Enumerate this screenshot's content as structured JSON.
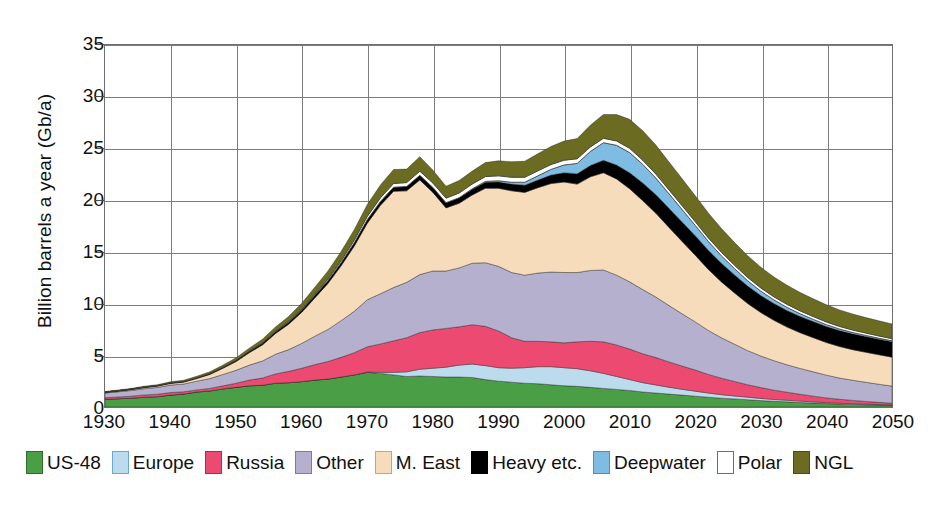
{
  "chart_data": {
    "type": "area",
    "title": "",
    "subtitle": "",
    "xlabel": "",
    "ylabel": "Billion barrels a year (Gb/a)",
    "xlim": [
      1930,
      2050
    ],
    "ylim": [
      0,
      35
    ],
    "grid": true,
    "stacked": true,
    "legend_position": "bottom",
    "xticks": [
      1930,
      1940,
      1950,
      1960,
      1970,
      1980,
      1990,
      2000,
      2010,
      2020,
      2030,
      2040,
      2050
    ],
    "yticks": [
      0,
      5,
      10,
      15,
      20,
      25,
      30,
      35
    ],
    "x": [
      1930,
      1932,
      1934,
      1936,
      1938,
      1940,
      1942,
      1944,
      1946,
      1948,
      1950,
      1952,
      1954,
      1956,
      1958,
      1960,
      1962,
      1964,
      1966,
      1968,
      1970,
      1972,
      1974,
      1976,
      1978,
      1980,
      1982,
      1984,
      1986,
      1988,
      1990,
      1992,
      1994,
      1996,
      1998,
      2000,
      2002,
      2004,
      2006,
      2008,
      2010,
      2012,
      2014,
      2016,
      2018,
      2020,
      2022,
      2024,
      2026,
      2028,
      2030,
      2032,
      2034,
      2036,
      2038,
      2040,
      2042,
      2044,
      2046,
      2048,
      2050
    ],
    "series": [
      {
        "name": "US-48",
        "color": "#4a9e46",
        "values": [
          0.75,
          0.8,
          0.85,
          0.95,
          1.0,
          1.15,
          1.25,
          1.45,
          1.55,
          1.75,
          1.9,
          2.05,
          2.1,
          2.3,
          2.35,
          2.45,
          2.6,
          2.7,
          2.9,
          3.1,
          3.35,
          3.25,
          3.1,
          2.95,
          3.0,
          2.95,
          2.9,
          2.9,
          2.85,
          2.65,
          2.5,
          2.4,
          2.3,
          2.25,
          2.15,
          2.05,
          2.0,
          1.9,
          1.8,
          1.7,
          1.6,
          1.45,
          1.35,
          1.25,
          1.15,
          1.05,
          0.95,
          0.85,
          0.78,
          0.7,
          0.62,
          0.55,
          0.5,
          0.44,
          0.38,
          0.33,
          0.29,
          0.25,
          0.22,
          0.19,
          0.16
        ]
      },
      {
        "name": "Europe",
        "color": "#bcdcee",
        "values": [
          0.0,
          0.0,
          0.0,
          0.0,
          0.0,
          0.0,
          0.0,
          0.0,
          0.0,
          0.0,
          0.0,
          0.0,
          0.0,
          0.0,
          0.0,
          0.0,
          0.0,
          0.0,
          0.0,
          0.0,
          0.02,
          0.1,
          0.25,
          0.45,
          0.65,
          0.8,
          0.95,
          1.15,
          1.3,
          1.35,
          1.3,
          1.35,
          1.5,
          1.65,
          1.75,
          1.75,
          1.7,
          1.6,
          1.45,
          1.25,
          1.05,
          0.9,
          0.78,
          0.66,
          0.56,
          0.48,
          0.4,
          0.34,
          0.29,
          0.25,
          0.21,
          0.18,
          0.15,
          0.13,
          0.11,
          0.09,
          0.08,
          0.07,
          0.06,
          0.05,
          0.04
        ]
      },
      {
        "name": "Russia",
        "color": "#ed4a72",
        "values": [
          0.15,
          0.17,
          0.2,
          0.22,
          0.24,
          0.25,
          0.22,
          0.2,
          0.25,
          0.3,
          0.4,
          0.55,
          0.7,
          0.9,
          1.1,
          1.3,
          1.5,
          1.7,
          1.9,
          2.15,
          2.45,
          2.75,
          3.05,
          3.3,
          3.55,
          3.7,
          3.75,
          3.7,
          3.8,
          3.8,
          3.55,
          2.95,
          2.55,
          2.45,
          2.4,
          2.4,
          2.6,
          2.85,
          3.05,
          3.05,
          2.95,
          2.8,
          2.65,
          2.45,
          2.25,
          2.05,
          1.8,
          1.6,
          1.4,
          1.2,
          1.05,
          0.9,
          0.78,
          0.66,
          0.56,
          0.46,
          0.38,
          0.32,
          0.26,
          0.21,
          0.17
        ]
      },
      {
        "name": "Other",
        "color": "#b4b0cd",
        "values": [
          0.45,
          0.5,
          0.55,
          0.6,
          0.65,
          0.72,
          0.75,
          0.85,
          0.95,
          1.1,
          1.25,
          1.45,
          1.65,
          1.9,
          2.1,
          2.4,
          2.75,
          3.1,
          3.55,
          4.0,
          4.55,
          4.85,
          5.15,
          5.35,
          5.6,
          5.7,
          5.55,
          5.7,
          5.95,
          6.15,
          6.25,
          6.3,
          6.4,
          6.6,
          6.75,
          6.8,
          6.7,
          6.85,
          6.95,
          6.75,
          6.5,
          6.2,
          5.85,
          5.45,
          5.05,
          4.65,
          4.25,
          3.9,
          3.6,
          3.3,
          3.05,
          2.85,
          2.65,
          2.5,
          2.35,
          2.2,
          2.05,
          1.95,
          1.85,
          1.75,
          1.65
        ]
      },
      {
        "name": "M. East",
        "color": "#f7dcbb",
        "values": [
          0.05,
          0.06,
          0.08,
          0.1,
          0.12,
          0.15,
          0.18,
          0.25,
          0.4,
          0.6,
          0.85,
          1.2,
          1.55,
          2.0,
          2.45,
          3.0,
          3.7,
          4.45,
          5.3,
          6.3,
          7.4,
          8.55,
          9.3,
          8.85,
          9.15,
          7.6,
          6.1,
          6.25,
          6.6,
          7.2,
          7.55,
          7.9,
          8.0,
          8.25,
          8.55,
          8.75,
          8.55,
          9.05,
          9.4,
          9.3,
          9.0,
          8.6,
          8.1,
          7.55,
          7.0,
          6.45,
          5.9,
          5.4,
          4.95,
          4.55,
          4.2,
          3.9,
          3.65,
          3.45,
          3.3,
          3.15,
          3.05,
          2.95,
          2.9,
          2.85,
          2.8
        ]
      },
      {
        "name": "Heavy etc.",
        "color": "#000000",
        "values": [
          0.05,
          0.05,
          0.05,
          0.06,
          0.06,
          0.07,
          0.07,
          0.08,
          0.09,
          0.1,
          0.12,
          0.14,
          0.16,
          0.18,
          0.2,
          0.22,
          0.25,
          0.28,
          0.3,
          0.33,
          0.36,
          0.38,
          0.4,
          0.42,
          0.45,
          0.48,
          0.5,
          0.52,
          0.55,
          0.58,
          0.6,
          0.65,
          0.7,
          0.75,
          0.82,
          0.9,
          1.0,
          1.1,
          1.2,
          1.35,
          1.55,
          1.7,
          1.8,
          1.85,
          1.88,
          1.88,
          1.85,
          1.8,
          1.75,
          1.7,
          1.65,
          1.62,
          1.6,
          1.58,
          1.56,
          1.55,
          1.54,
          1.53,
          1.52,
          1.51,
          1.5
        ]
      },
      {
        "name": "Deepwater",
        "color": "#7fbce4",
        "values": [
          0.0,
          0.0,
          0.0,
          0.0,
          0.0,
          0.0,
          0.0,
          0.0,
          0.0,
          0.0,
          0.0,
          0.0,
          0.0,
          0.0,
          0.0,
          0.0,
          0.0,
          0.0,
          0.0,
          0.0,
          0.0,
          0.0,
          0.0,
          0.0,
          0.0,
          0.0,
          0.0,
          0.02,
          0.05,
          0.08,
          0.12,
          0.18,
          0.28,
          0.4,
          0.55,
          0.75,
          1.0,
          1.35,
          1.7,
          1.9,
          1.95,
          1.8,
          1.6,
          1.4,
          1.2,
          1.0,
          0.85,
          0.72,
          0.6,
          0.5,
          0.42,
          0.35,
          0.3,
          0.25,
          0.21,
          0.18,
          0.15,
          0.13,
          0.11,
          0.09,
          0.08
        ]
      },
      {
        "name": "Polar",
        "color": "#ffffff",
        "values": [
          0.0,
          0.0,
          0.0,
          0.0,
          0.0,
          0.0,
          0.0,
          0.0,
          0.0,
          0.0,
          0.0,
          0.0,
          0.02,
          0.04,
          0.06,
          0.08,
          0.1,
          0.14,
          0.18,
          0.24,
          0.3,
          0.34,
          0.36,
          0.38,
          0.4,
          0.42,
          0.44,
          0.45,
          0.46,
          0.47,
          0.48,
          0.48,
          0.48,
          0.48,
          0.47,
          0.46,
          0.45,
          0.44,
          0.43,
          0.42,
          0.41,
          0.4,
          0.39,
          0.38,
          0.37,
          0.36,
          0.35,
          0.34,
          0.33,
          0.32,
          0.31,
          0.3,
          0.29,
          0.28,
          0.27,
          0.26,
          0.25,
          0.24,
          0.23,
          0.22,
          0.21
        ]
      },
      {
        "name": "NGL",
        "color": "#6b6b22",
        "values": [
          0.05,
          0.06,
          0.07,
          0.08,
          0.09,
          0.1,
          0.12,
          0.14,
          0.17,
          0.2,
          0.25,
          0.3,
          0.36,
          0.42,
          0.5,
          0.58,
          0.68,
          0.78,
          0.9,
          1.02,
          1.15,
          1.25,
          1.35,
          1.3,
          1.4,
          1.25,
          1.15,
          1.2,
          1.25,
          1.35,
          1.45,
          1.5,
          1.55,
          1.65,
          1.75,
          1.85,
          1.95,
          2.1,
          2.3,
          2.55,
          2.8,
          2.85,
          2.8,
          2.7,
          2.6,
          2.5,
          2.4,
          2.3,
          2.2,
          2.1,
          2.0,
          1.92,
          1.85,
          1.78,
          1.72,
          1.66,
          1.6,
          1.55,
          1.5,
          1.46,
          1.42
        ]
      }
    ]
  },
  "legend": {
    "items": [
      {
        "label": "US-48",
        "color": "#4a9e46",
        "border": "#2f6d2c"
      },
      {
        "label": "Europe",
        "color": "#bcdcee",
        "border": "#6ba8cd"
      },
      {
        "label": "Russia",
        "color": "#ed4a72",
        "border": "#b8284c"
      },
      {
        "label": "Other",
        "color": "#b4b0cd",
        "border": "#7f7b9c"
      },
      {
        "label": "M. East",
        "color": "#f7dcbb",
        "border": "#c9a478"
      },
      {
        "label": "Heavy etc.",
        "color": "#000000",
        "border": "#000000"
      },
      {
        "label": "Deepwater",
        "color": "#7fbce4",
        "border": "#4d8fbd"
      },
      {
        "label": "Polar",
        "color": "#ffffff",
        "border": "#6e6e6e"
      },
      {
        "label": "NGL",
        "color": "#6b6b22",
        "border": "#4a4a14"
      }
    ]
  },
  "axes": {
    "y_title": "Billion barrels a year (Gb/a)",
    "y_ticks": [
      "0",
      "5",
      "10",
      "15",
      "20",
      "25",
      "30",
      "35"
    ],
    "x_ticks": [
      "1930",
      "1940",
      "1950",
      "1960",
      "1970",
      "1980",
      "1990",
      "2000",
      "2010",
      "2020",
      "2030",
      "2040",
      "2050"
    ]
  }
}
